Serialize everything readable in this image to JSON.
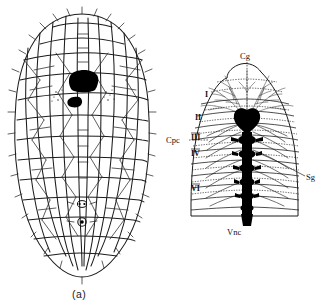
{
  "figure": {
    "background_color": "#ffffff",
    "ink_color": "#111111",
    "panels": [
      {
        "id": "a",
        "caption": "(a)",
        "subject": "peripheral nerve plexus network"
      },
      {
        "id": "b",
        "caption": "(b)",
        "subject": "central nervous system with segmental ganglia"
      }
    ]
  },
  "panel_a": {
    "caption": "(a)"
  },
  "panel_b": {
    "caption": "(b)",
    "labels": {
      "cerebral_ganglion": "Cg",
      "circumpharyngeal_connective": "Cpc",
      "segmental_ganglion": "Sg",
      "ventral_nerve_cord": "Vnc"
    },
    "segments": [
      {
        "numeral": "I"
      },
      {
        "numeral": "II"
      },
      {
        "numeral": "III"
      },
      {
        "numeral": "IV"
      },
      {
        "numeral": "VI"
      }
    ]
  }
}
